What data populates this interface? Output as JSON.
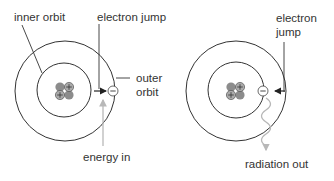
{
  "diagrams": [
    {
      "name": "electron-excitation",
      "labels": {
        "inner_orbit": "inner orbit",
        "electron_jump": "electron jump",
        "outer_orbit_1": "outer",
        "outer_orbit_2": "orbit",
        "energy_in": "energy in"
      }
    },
    {
      "name": "electron-de-excitation",
      "labels": {
        "electron_jump_1": "electron",
        "electron_jump_2": "jump",
        "radiation_out": "radiation out"
      }
    }
  ],
  "symbols": {
    "proton": "+",
    "electron": "−"
  },
  "colors": {
    "line": "#333333",
    "nucleon": "#8c8c8c",
    "energy_arrow": "#b8b8b8",
    "electron_fill": "#ffffff"
  }
}
